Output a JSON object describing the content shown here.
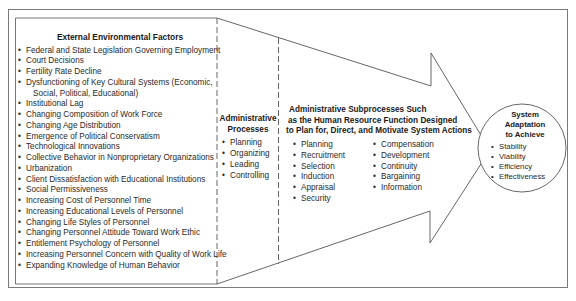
{
  "external": {
    "title": "External Environmental Factors",
    "items": [
      "Federal and State Legislation Governing Employment",
      "Court Decisions",
      "Fertility Rate Decline",
      "Dysfunctioning of Key Cultural Systems (Economic,",
      "Social, Political, Educational)",
      "Institutional Lag",
      "Changing Composition of Work Force",
      "Changing Age Distribution",
      "Emergence of Political Conservatism",
      "Technological Innovations",
      "Collective Behavior in Nonproprietary Organizations",
      "Urbanization",
      "Client Dissatisfaction with Educational Institutions",
      "Social Permissiveness",
      "Increasing Cost of Personnel Time",
      "Increasing Educational Levels of Personnel",
      "Changing Life Styles of Personnel",
      "Changing Personnel Attitude Toward Work Ethic",
      "Entitlement Psychology of Personnel",
      "Increasing Personnel Concern with Quality of Work Life",
      "Expanding Knowledge of Human Behavior"
    ]
  },
  "admin": {
    "title_line1": "Administrative",
    "title_line2": "Processes",
    "items": [
      "Planning",
      "Organizing",
      "Leading",
      "Controlling"
    ]
  },
  "subprocesses": {
    "title_line1": "Administrative Subprocesses Such",
    "title_line2": "as the Human Resource Function Designed",
    "title_line3": "to Plan for, Direct, and Motivate System Actions",
    "col1": [
      "Planning",
      "Recruitment",
      "Selection",
      "Induction",
      "Appraisal",
      "Security"
    ],
    "col2": [
      "Compensation",
      "Development",
      "Continuity",
      "Bargaining",
      "Information"
    ]
  },
  "adaptation": {
    "title_line1": "System",
    "title_line2": "Adaptation",
    "title_line3": "to Achieve",
    "items": [
      "Stability",
      "Viability",
      "Efficiency",
      "Effectiveness"
    ]
  },
  "colors": {
    "stroke": "#555555",
    "frame": "#777777",
    "text": "#2a2a2a"
  }
}
